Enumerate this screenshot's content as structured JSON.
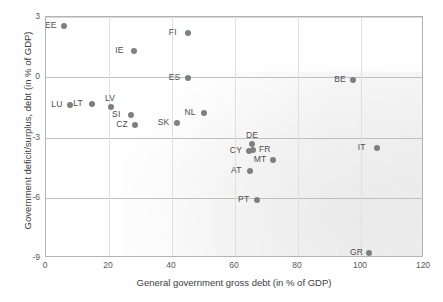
{
  "chart_data": {
    "type": "scatter",
    "title": "",
    "xlabel": "General government gross debt (in % of GDP)",
    "ylabel": "Government deficit/surplus, debt (in % of GDP)",
    "xlim": [
      0,
      120
    ],
    "ylim": [
      -9,
      3
    ],
    "xticks": [
      "0",
      "20",
      "40",
      "60",
      "80",
      "100",
      "120"
    ],
    "yticks": [
      "3",
      "0",
      "-3",
      "-6",
      "-9"
    ],
    "grid": "horizontal gridlines at 3, 0, -3, -6, -9; faint vertical gridlines at 20-unit intervals",
    "legend": "none",
    "marker_color": "#7f7f7f",
    "points": [
      {
        "label": "EE",
        "x": 5.7,
        "y": 2.55,
        "label_pos": "left"
      },
      {
        "label": "FI",
        "x": 45.0,
        "y": 2.2,
        "label_pos": "left"
      },
      {
        "label": "IE",
        "x": 28.0,
        "y": 1.3,
        "label_pos": "left"
      },
      {
        "label": "ES",
        "x": 45.0,
        "y": -0.05,
        "label_pos": "left"
      },
      {
        "label": "BE",
        "x": 97.5,
        "y": -0.15,
        "label_pos": "left"
      },
      {
        "label": "LU",
        "x": 7.7,
        "y": -1.4,
        "label_pos": "left"
      },
      {
        "label": "LT",
        "x": 14.7,
        "y": -1.35,
        "label_pos": "left"
      },
      {
        "label": "LV",
        "x": 20.6,
        "y": -1.5,
        "label_pos": "above"
      },
      {
        "label": "SI",
        "x": 27.0,
        "y": -1.9,
        "label_pos": "left"
      },
      {
        "label": "CZ",
        "x": 28.3,
        "y": -2.4,
        "label_pos": "left"
      },
      {
        "label": "SK",
        "x": 41.5,
        "y": -2.3,
        "label_pos": "left"
      },
      {
        "label": "NL",
        "x": 50.0,
        "y": -1.8,
        "label_pos": "left"
      },
      {
        "label": "DE",
        "x": 65.4,
        "y": -3.3,
        "label_pos": "above"
      },
      {
        "label": "CY",
        "x": 64.4,
        "y": -3.65,
        "label_pos": "left"
      },
      {
        "label": "FR",
        "x": 65.7,
        "y": -3.6,
        "label_pos": "right"
      },
      {
        "label": "MT",
        "x": 72.0,
        "y": -4.1,
        "label_pos": "left"
      },
      {
        "label": "AT",
        "x": 64.8,
        "y": -4.65,
        "label_pos": "left"
      },
      {
        "label": "PT",
        "x": 67.0,
        "y": -6.1,
        "label_pos": "left"
      },
      {
        "label": "IT",
        "x": 105.0,
        "y": -3.5,
        "label_pos": "left"
      },
      {
        "label": "GR",
        "x": 102.5,
        "y": -8.75,
        "label_pos": "left"
      }
    ]
  }
}
